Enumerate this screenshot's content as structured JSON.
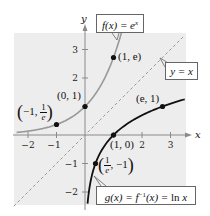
{
  "chart_data": {
    "type": "line",
    "title": "",
    "xlabel": "x",
    "ylabel": "y",
    "xlim": [
      -2.5,
      3.5
    ],
    "ylim": [
      -2.5,
      3.5
    ],
    "grid": false,
    "background_color": "#eeeeee",
    "x_ticks": [
      -2,
      -1,
      1,
      2,
      3
    ],
    "x_tick_labels": [
      "−2",
      "−1",
      "",
      "2",
      "3"
    ],
    "y_ticks": [
      -2,
      -1,
      1,
      2,
      3
    ],
    "y_tick_labels": [
      "−2",
      "−1",
      "",
      "2",
      "3"
    ],
    "series": [
      {
        "name": "f(x) = e^x",
        "function": "exp",
        "color": "#999999",
        "style": "solid",
        "x_range": [
          -2.4,
          1.3
        ],
        "points": [
          {
            "x": -1,
            "y": 0.368,
            "label": "(−1, 1/e)"
          },
          {
            "x": 0,
            "y": 1,
            "label": "(0, 1)"
          },
          {
            "x": 1,
            "y": 2.718,
            "label": "(1, e)"
          }
        ]
      },
      {
        "name": "g(x) = f⁻¹(x) = ln x",
        "function": "ln",
        "color": "#111111",
        "style": "solid",
        "x_range": [
          0.09,
          3.5
        ],
        "points": [
          {
            "x": 0.368,
            "y": -1,
            "label": "(1/e, −1)"
          },
          {
            "x": 1,
            "y": 0,
            "label": "(1, 0)"
          },
          {
            "x": 2.718,
            "y": 1,
            "label": "(e, 1)"
          }
        ]
      },
      {
        "name": "y = x",
        "function": "identity",
        "color": "#999999",
        "style": "dashed",
        "x_range": [
          -2.5,
          3.5
        ]
      }
    ],
    "legend": [
      {
        "text": "f(x) = e^x",
        "position": "top-center"
      },
      {
        "text": "y = x",
        "position": "right"
      },
      {
        "text": "g(x) = f^-1(x) = ln x",
        "position": "bottom-right"
      }
    ]
  },
  "axes": {
    "x_label": "x",
    "y_label": "y",
    "ticks_x": [
      "−2",
      "−1",
      "2",
      "3"
    ],
    "ticks_y": [
      "3",
      "2",
      "−1",
      "−2"
    ]
  },
  "labels": {
    "f_box": {
      "prefix": "f(x) = e",
      "sup": "x"
    },
    "yx_box": "y = x",
    "g_box": {
      "a": "g(x) = f",
      "sup": "−1",
      "b": "(x) = ",
      "ln": "ln",
      "x": " x"
    },
    "pt_neg1": {
      "open": "(",
      "text": "−1, ",
      "num": "1",
      "den": "e",
      "close": ")"
    },
    "pt_01": "(0, 1)",
    "pt_1e": "(1, e)",
    "pt_e1": "(e, 1)",
    "pt_10": "(1, 0)",
    "pt_inv_e": {
      "open": "(",
      "num": "1",
      "den": "e",
      "text": ", −1",
      "close": ")"
    }
  }
}
